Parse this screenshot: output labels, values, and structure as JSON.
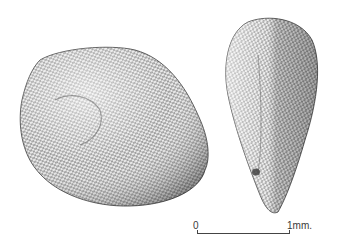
{
  "figure": {
    "views": [
      {
        "name": "lateral view",
        "shape": "broad ovoid",
        "texture": "reticulate / alveolate surface"
      },
      {
        "name": "edge view",
        "shape": "obovoid tapering to base",
        "texture": "reticulate / alveolate surface",
        "feature": "hilum near base"
      }
    ],
    "ink_color": "#2a2a2a",
    "background": "#ffffff"
  },
  "scale_bar": {
    "start_label": "0",
    "end_label": "1mm."
  }
}
